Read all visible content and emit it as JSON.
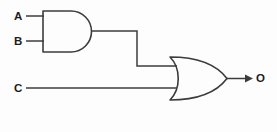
{
  "diagram": {
    "background_color": "#fdfdfd",
    "line_color": "#3c3c3c",
    "label_color": "#1d1d1d",
    "inputs": [
      {
        "id": "A",
        "label": "A",
        "x": 17,
        "y": 16,
        "wire_from_x": 26,
        "wire_to_x": 43,
        "wire_y": 16
      },
      {
        "id": "B",
        "label": "B",
        "x": 17,
        "y": 41,
        "wire_from_x": 26,
        "wire_to_x": 43,
        "wire_y": 41
      },
      {
        "id": "C",
        "label": "C",
        "x": 17,
        "y": 88,
        "wire_from_x": 26,
        "wire_to_x": 176,
        "wire_y": 88
      }
    ],
    "outputs": [
      {
        "id": "O",
        "label": "O",
        "x": 260,
        "y": 78,
        "wire_from_x": 227,
        "wire_to_x": 250,
        "wire_y": 78
      }
    ],
    "gates": [
      {
        "id": "and1",
        "type": "AND",
        "inputs": [
          "A",
          "B"
        ],
        "output": "and1_out",
        "x": 43,
        "y": 11,
        "width": 49,
        "height": 41
      },
      {
        "id": "or1",
        "type": "OR",
        "inputs": [
          "and1_out",
          "C"
        ],
        "output": "O",
        "x": 170,
        "y": 57,
        "width": 57,
        "height": 43
      }
    ],
    "wires": [
      {
        "id": "a-in",
        "points": "26,16 43,16"
      },
      {
        "id": "b-in",
        "points": "26,41 43,41"
      },
      {
        "id": "c-in",
        "points": "26,88 176,88"
      },
      {
        "id": "and-to-or",
        "points": "92,31 137,31 137,66 176,66"
      },
      {
        "id": "or-out",
        "points": "227,78 248,78"
      }
    ]
  }
}
